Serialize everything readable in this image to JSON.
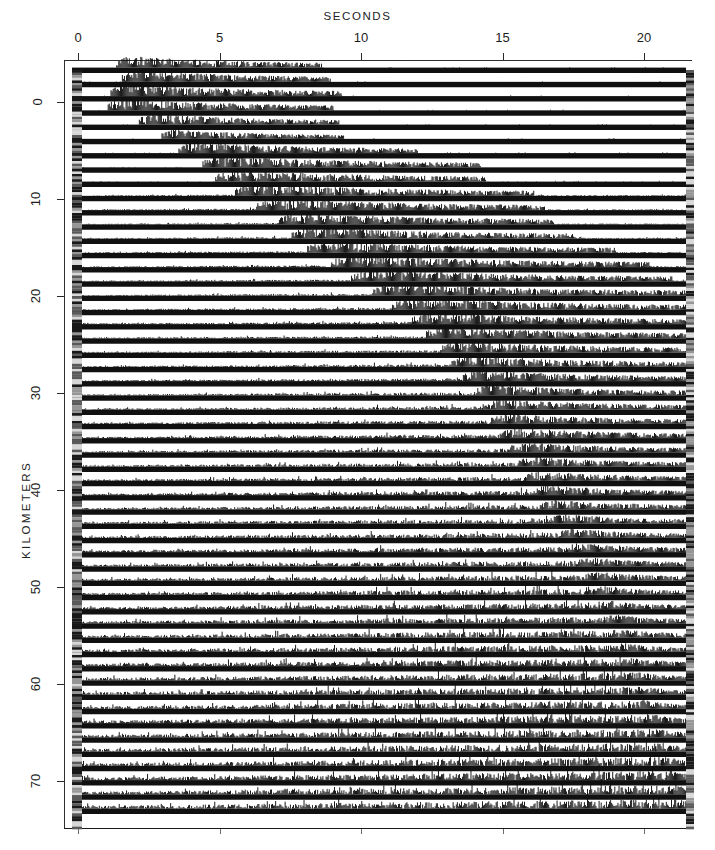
{
  "figure": {
    "type": "seismic-record-section",
    "background_color": "#ffffff",
    "ink_color": "#101010"
  },
  "axes": {
    "x": {
      "title": "SECONDS",
      "ticks": [
        {
          "label": "0",
          "value": 0
        },
        {
          "label": "5",
          "value": 5
        },
        {
          "label": "10",
          "value": 10
        },
        {
          "label": "15",
          "value": 15
        },
        {
          "label": "20",
          "value": 20
        }
      ],
      "range": [
        -0.5,
        22.2
      ],
      "pixel_per_unit": 28.3
    },
    "y": {
      "title": "KILOMETERS",
      "ticks": [
        {
          "label": "0",
          "value": 0
        },
        {
          "label": "10",
          "value": 10
        },
        {
          "label": "20",
          "value": 20
        },
        {
          "label": "30",
          "value": 30
        },
        {
          "label": "40",
          "value": 40
        },
        {
          "label": "50",
          "value": 50
        },
        {
          "label": "60",
          "value": 60
        },
        {
          "label": "70",
          "value": 70
        }
      ],
      "range": [
        -3,
        75
      ],
      "pixel_per_unit": 9.7
    }
  },
  "chart_data": {
    "type": "line",
    "title": "SECONDS",
    "xlabel": "SECONDS",
    "ylabel": "KILOMETERS",
    "xlim": [
      -0.5,
      22.2
    ],
    "ylim": [
      75,
      -3
    ],
    "grid": false,
    "legend": null,
    "plot_area_px": {
      "left": 64,
      "top": 60,
      "right": 692,
      "bottom": 828
    },
    "trace_area_px": {
      "left": 72,
      "top": 70,
      "right": 686,
      "bottom": 827
    },
    "gain_strip_px": {
      "left_x": 72,
      "right_x": 686,
      "width": 10
    },
    "trace_count": 53,
    "trace_spacing_px": 14.25,
    "trace_baseline_thickness_px": 5.4,
    "traces": [
      {
        "km": 0.0,
        "first_arrival_s": 1.35,
        "coda_end_s": 8.6,
        "noise_level": 0.06,
        "burst_amp": 0.92
      },
      {
        "km": 1.4,
        "first_arrival_s": 1.55,
        "coda_end_s": 8.9,
        "noise_level": 0.06,
        "burst_amp": 0.95
      },
      {
        "km": 2.8,
        "first_arrival_s": 1.15,
        "coda_end_s": 9.3,
        "noise_level": 0.07,
        "burst_amp": 0.98
      },
      {
        "km": 4.2,
        "first_arrival_s": 1.05,
        "coda_end_s": 9.0,
        "noise_level": 0.07,
        "burst_amp": 0.96
      },
      {
        "km": 5.6,
        "first_arrival_s": 2.15,
        "coda_end_s": 9.2,
        "noise_level": 0.06,
        "burst_amp": 0.9
      },
      {
        "km": 7.0,
        "first_arrival_s": 2.95,
        "coda_end_s": 9.4,
        "noise_level": 0.06,
        "burst_amp": 0.75
      },
      {
        "km": 8.4,
        "first_arrival_s": 3.55,
        "coda_end_s": 12.0,
        "noise_level": 0.07,
        "burst_amp": 0.88
      },
      {
        "km": 9.8,
        "first_arrival_s": 4.4,
        "coda_end_s": 14.2,
        "noise_level": 0.07,
        "burst_amp": 0.92
      },
      {
        "km": 11.2,
        "first_arrival_s": 4.85,
        "coda_end_s": 14.4,
        "noise_level": 0.08,
        "burst_amp": 0.94
      },
      {
        "km": 12.6,
        "first_arrival_s": 5.55,
        "coda_end_s": 16.1,
        "noise_level": 0.14,
        "burst_amp": 0.96
      },
      {
        "km": 14.0,
        "first_arrival_s": 6.3,
        "coda_end_s": 16.5,
        "noise_level": 0.15,
        "burst_amp": 0.95
      },
      {
        "km": 15.4,
        "first_arrival_s": 7.1,
        "coda_end_s": 16.8,
        "noise_level": 0.15,
        "burst_amp": 0.97
      },
      {
        "km": 16.8,
        "first_arrival_s": 7.55,
        "coda_end_s": 17.6,
        "noise_level": 0.16,
        "burst_amp": 0.93
      },
      {
        "km": 18.2,
        "first_arrival_s": 8.1,
        "coda_end_s": 19.0,
        "noise_level": 0.17,
        "burst_amp": 0.95
      },
      {
        "km": 19.6,
        "first_arrival_s": 8.95,
        "coda_end_s": 20.2,
        "noise_level": 0.18,
        "burst_amp": 0.96
      },
      {
        "km": 21.0,
        "first_arrival_s": 9.65,
        "coda_end_s": 21.0,
        "noise_level": 0.19,
        "burst_amp": 0.94
      },
      {
        "km": 22.4,
        "first_arrival_s": 10.4,
        "coda_end_s": 21.6,
        "noise_level": 0.2,
        "burst_amp": 0.96
      },
      {
        "km": 23.8,
        "first_arrival_s": 11.1,
        "coda_end_s": 22.0,
        "noise_level": 0.21,
        "burst_amp": 0.95
      },
      {
        "km": 25.2,
        "first_arrival_s": 11.8,
        "coda_end_s": 22.0,
        "noise_level": 0.22,
        "burst_amp": 0.93
      },
      {
        "km": 26.6,
        "first_arrival_s": 12.3,
        "coda_end_s": 22.0,
        "noise_level": 0.23,
        "burst_amp": 0.94
      },
      {
        "km": 28.0,
        "first_arrival_s": 12.8,
        "coda_end_s": 22.0,
        "noise_level": 0.24,
        "burst_amp": 0.92
      },
      {
        "km": 29.4,
        "first_arrival_s": 13.2,
        "coda_end_s": 22.0,
        "noise_level": 0.26,
        "burst_amp": 0.9
      },
      {
        "km": 30.8,
        "first_arrival_s": 13.6,
        "coda_end_s": 22.0,
        "noise_level": 0.28,
        "burst_amp": 0.88
      },
      {
        "km": 32.2,
        "first_arrival_s": 14.0,
        "coda_end_s": 22.0,
        "noise_level": 0.3,
        "burst_amp": 0.86
      },
      {
        "km": 33.6,
        "first_arrival_s": 14.3,
        "coda_end_s": 22.0,
        "noise_level": 0.32,
        "burst_amp": 0.85
      },
      {
        "km": 35.0,
        "first_arrival_s": 14.6,
        "coda_end_s": 22.0,
        "noise_level": 0.34,
        "burst_amp": 0.84
      },
      {
        "km": 36.4,
        "first_arrival_s": 14.9,
        "coda_end_s": 22.0,
        "noise_level": 0.36,
        "burst_amp": 0.83
      },
      {
        "km": 37.8,
        "first_arrival_s": 15.2,
        "coda_end_s": 22.0,
        "noise_level": 0.38,
        "burst_amp": 0.82
      },
      {
        "km": 39.2,
        "first_arrival_s": 15.5,
        "coda_end_s": 22.0,
        "noise_level": 0.4,
        "burst_amp": 0.81
      },
      {
        "km": 40.6,
        "first_arrival_s": 15.8,
        "coda_end_s": 22.0,
        "noise_level": 0.42,
        "burst_amp": 0.8
      },
      {
        "km": 42.0,
        "first_arrival_s": 16.1,
        "coda_end_s": 22.0,
        "noise_level": 0.44,
        "burst_amp": 0.79
      },
      {
        "km": 43.4,
        "first_arrival_s": 16.4,
        "coda_end_s": 22.0,
        "noise_level": 0.46,
        "burst_amp": 0.78
      },
      {
        "km": 44.8,
        "first_arrival_s": 16.7,
        "coda_end_s": 22.0,
        "noise_level": 0.48,
        "burst_amp": 0.77
      },
      {
        "km": 46.2,
        "first_arrival_s": 17.0,
        "coda_end_s": 22.0,
        "noise_level": 0.5,
        "burst_amp": 0.76
      },
      {
        "km": 47.6,
        "first_arrival_s": 17.3,
        "coda_end_s": 22.0,
        "noise_level": 0.52,
        "burst_amp": 0.76
      },
      {
        "km": 49.0,
        "first_arrival_s": 17.6,
        "coda_end_s": 22.0,
        "noise_level": 0.55,
        "burst_amp": 0.75
      },
      {
        "km": 50.4,
        "first_arrival_s": 17.9,
        "coda_end_s": 22.0,
        "noise_level": 0.58,
        "burst_amp": 0.74
      },
      {
        "km": 51.8,
        "first_arrival_s": 18.2,
        "coda_end_s": 22.0,
        "noise_level": 0.6,
        "burst_amp": 0.74
      },
      {
        "km": 53.2,
        "first_arrival_s": 18.4,
        "coda_end_s": 22.0,
        "noise_level": 0.63,
        "burst_amp": 0.73
      },
      {
        "km": 54.6,
        "first_arrival_s": 18.6,
        "coda_end_s": 22.0,
        "noise_level": 0.66,
        "burst_amp": 0.73
      },
      {
        "km": 56.0,
        "first_arrival_s": 18.8,
        "coda_end_s": 22.0,
        "noise_level": 0.69,
        "burst_amp": 0.72
      },
      {
        "km": 57.4,
        "first_arrival_s": 19.0,
        "coda_end_s": 22.0,
        "noise_level": 0.72,
        "burst_amp": 0.72
      },
      {
        "km": 58.8,
        "first_arrival_s": 19.2,
        "coda_end_s": 22.0,
        "noise_level": 0.74,
        "burst_amp": 0.71
      },
      {
        "km": 60.2,
        "first_arrival_s": 19.4,
        "coda_end_s": 22.0,
        "noise_level": 0.76,
        "burst_amp": 0.71
      },
      {
        "km": 61.6,
        "first_arrival_s": 19.6,
        "coda_end_s": 22.0,
        "noise_level": 0.78,
        "burst_amp": 0.72
      },
      {
        "km": 63.0,
        "first_arrival_s": 19.8,
        "coda_end_s": 22.0,
        "noise_level": 0.8,
        "burst_amp": 0.74
      },
      {
        "km": 64.4,
        "first_arrival_s": 20.0,
        "coda_end_s": 22.0,
        "noise_level": 0.82,
        "burst_amp": 0.76
      },
      {
        "km": 65.8,
        "first_arrival_s": 20.2,
        "coda_end_s": 22.0,
        "noise_level": 0.84,
        "burst_amp": 0.78
      },
      {
        "km": 67.2,
        "first_arrival_s": 20.4,
        "coda_end_s": 22.0,
        "noise_level": 0.86,
        "burst_amp": 0.8
      },
      {
        "km": 68.6,
        "first_arrival_s": 20.6,
        "coda_end_s": 22.0,
        "noise_level": 0.88,
        "burst_amp": 0.82
      },
      {
        "km": 70.0,
        "first_arrival_s": 20.8,
        "coda_end_s": 22.0,
        "noise_level": 0.9,
        "burst_amp": 0.84
      },
      {
        "km": 71.4,
        "first_arrival_s": 21.0,
        "coda_end_s": 22.0,
        "noise_level": 0.92,
        "burst_amp": 0.86
      },
      {
        "km": 72.8,
        "first_arrival_s": 21.2,
        "coda_end_s": 22.0,
        "noise_level": 0.94,
        "burst_amp": 0.88
      }
    ]
  }
}
